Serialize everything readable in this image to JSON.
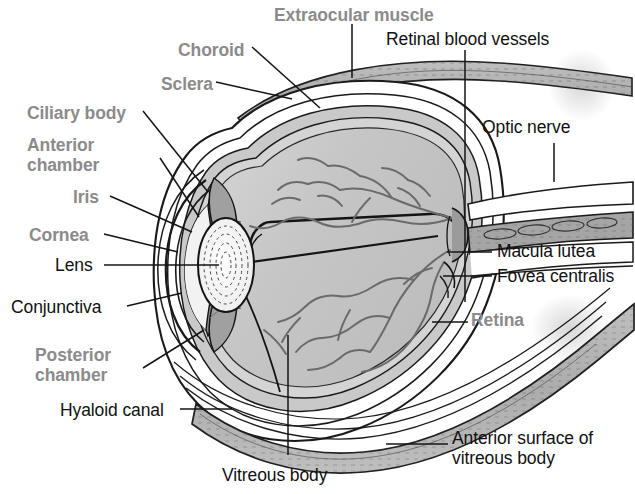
{
  "figure": {
    "background_color": "#ffffff",
    "width": 635,
    "height": 494,
    "label_colors": {
      "black": "#111111",
      "gray": "#8b8b8b"
    },
    "tissue_colors": {
      "sclera_outer": "#ffffff",
      "choroid_band": "#b8b8b8",
      "muscle_band": "#b0b0b0",
      "vitreous_body": "#c3c3c3",
      "aqueous_upper": "#cccccc",
      "lens_fill": "#f7f7f7",
      "iris_ciliary": "#9a9a9a",
      "line_ink": "#1a1a1a"
    }
  },
  "labels": [
    {
      "id": "extraocular-muscle",
      "text": "Extraocular muscle",
      "style": "gray",
      "x": 274,
      "y": 5,
      "align": "start"
    },
    {
      "id": "retinal-blood-vessels",
      "text": "Retinal blood vessels",
      "style": "black",
      "x": 386,
      "y": 29,
      "align": "start"
    },
    {
      "id": "choroid",
      "text": "Choroid",
      "style": "gray",
      "x": 178,
      "y": 40,
      "align": "start"
    },
    {
      "id": "sclera",
      "text": "Sclera",
      "style": "gray",
      "x": 161,
      "y": 74,
      "align": "start"
    },
    {
      "id": "ciliary-body",
      "text": "Ciliary body",
      "style": "gray",
      "x": 27,
      "y": 103,
      "align": "start"
    },
    {
      "id": "optic-nerve",
      "text": "Optic nerve",
      "style": "black",
      "x": 482,
      "y": 117,
      "align": "start"
    },
    {
      "id": "anterior-chamber",
      "text": "Anterior\nchamber",
      "style": "gray",
      "x": 27,
      "y": 135,
      "align": "start"
    },
    {
      "id": "iris",
      "text": "Iris",
      "style": "gray",
      "x": 73,
      "y": 187,
      "align": "start"
    },
    {
      "id": "cornea",
      "text": "Cornea",
      "style": "gray",
      "x": 29,
      "y": 225,
      "align": "start"
    },
    {
      "id": "macula-lutea",
      "text": "Macula lutea",
      "style": "black",
      "x": 497,
      "y": 241,
      "align": "start"
    },
    {
      "id": "lens",
      "text": "Lens",
      "style": "black",
      "x": 55,
      "y": 255,
      "align": "start"
    },
    {
      "id": "fovea-centralis",
      "text": "Fovea centralis",
      "style": "black",
      "x": 497,
      "y": 266,
      "align": "start"
    },
    {
      "id": "conjunctiva",
      "text": "Conjunctiva",
      "style": "black",
      "x": 11,
      "y": 297,
      "align": "start"
    },
    {
      "id": "retina",
      "text": "Retina",
      "style": "gray",
      "x": 471,
      "y": 310,
      "align": "start"
    },
    {
      "id": "posterior-chamber",
      "text": "Posterior\nchamber",
      "style": "gray",
      "x": 35,
      "y": 345,
      "align": "start"
    },
    {
      "id": "hyaloid-canal",
      "text": "Hyaloid canal",
      "style": "black",
      "x": 60,
      "y": 400,
      "align": "start"
    },
    {
      "id": "anterior-surface",
      "text": "Anterior surface of\nvitreous body",
      "style": "black",
      "x": 452,
      "y": 428,
      "align": "start"
    },
    {
      "id": "vitreous-body",
      "text": "Vitreous body",
      "style": "black",
      "x": 222,
      "y": 465,
      "align": "start"
    }
  ],
  "leader_lines": [
    {
      "id": "leader-extraocular-muscle",
      "points": "352,24 352,78"
    },
    {
      "id": "leader-retinal-blood-vessels",
      "points": "465,50 465,302"
    },
    {
      "id": "leader-choroid",
      "points": "252,47 320,108"
    },
    {
      "id": "leader-sclera",
      "points": "216,82 292,99"
    },
    {
      "id": "leader-ciliary-body",
      "points": "143,111 208,192"
    },
    {
      "id": "leader-optic-nerve",
      "points": "554,143 554,182"
    },
    {
      "id": "leader-anterior-chamber",
      "points": "160,158 199,217"
    },
    {
      "id": "leader-iris",
      "points": "110,196 192,232"
    },
    {
      "id": "leader-cornea",
      "points": "104,234 178,252"
    },
    {
      "id": "leader-macula-lutea",
      "points": "447,252 492,252"
    },
    {
      "id": "leader-lens",
      "points": "104,265 219,265"
    },
    {
      "id": "leader-fovea-centralis",
      "points": "443,276 492,276"
    },
    {
      "id": "leader-conjunctiva",
      "points": "127,306 182,293"
    },
    {
      "id": "leader-retina",
      "points": "432,322 468,322"
    },
    {
      "id": "leader-posterior-chamber",
      "points": "143,368 204,330"
    },
    {
      "id": "leader-hyaloid-canal",
      "points": "180,409 232,409"
    },
    {
      "id": "leader-anterior-surface",
      "points": "386,444 448,444"
    },
    {
      "id": "leader-vitreous-body",
      "points": "288,455 288,335"
    }
  ],
  "structures": [
    {
      "id": "sclera-shell",
      "name": "sclera"
    },
    {
      "id": "choroid-layer",
      "name": "choroid"
    },
    {
      "id": "retina-layer",
      "name": "retina"
    },
    {
      "id": "vitreous-body",
      "name": "vitreous-body"
    },
    {
      "id": "lens",
      "name": "lens"
    },
    {
      "id": "cornea",
      "name": "cornea"
    },
    {
      "id": "iris",
      "name": "iris"
    },
    {
      "id": "ciliary-body",
      "name": "ciliary-body"
    },
    {
      "id": "anterior-chamber",
      "name": "anterior-chamber"
    },
    {
      "id": "posterior-chamber",
      "name": "posterior-chamber"
    },
    {
      "id": "optic-nerve",
      "name": "optic-nerve"
    },
    {
      "id": "extraocular-muscle-superior",
      "name": "extraocular-muscle"
    },
    {
      "id": "extraocular-muscle-inferior",
      "name": "extraocular-muscle"
    },
    {
      "id": "retinal-vessels",
      "name": "retinal-blood-vessels"
    },
    {
      "id": "macula-lutea",
      "name": "macula-lutea"
    },
    {
      "id": "fovea-centralis",
      "name": "fovea-centralis"
    },
    {
      "id": "hyaloid-canal",
      "name": "hyaloid-canal"
    },
    {
      "id": "anterior-surface-vitreous",
      "name": "anterior-surface-of-vitreous-body"
    }
  ]
}
